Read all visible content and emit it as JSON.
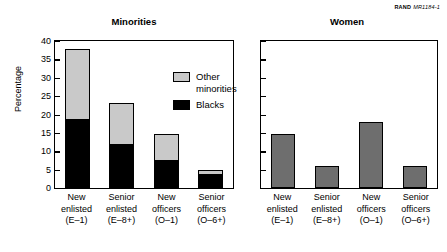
{
  "credit": {
    "brand": "RAND",
    "id": "MR1184-1"
  },
  "chart_data": {
    "type": "bar",
    "title": "",
    "categories": [
      "New enlisted (E–1)",
      "Senior enlisted (E–8+)",
      "New officers (O–1)",
      "Senior officers (O–6+)"
    ],
    "category_lines": [
      [
        "New",
        "enlisted",
        "(E–1)"
      ],
      [
        "Senior",
        "enlisted",
        "(E–8+)"
      ],
      [
        "New",
        "officers",
        "(O–1)"
      ],
      [
        "Senior",
        "officers",
        "(O–6+)"
      ]
    ],
    "ylabel": "Percentage",
    "ylim": [
      0,
      40
    ],
    "yticks": [
      40,
      35,
      30,
      25,
      20,
      15,
      10,
      5,
      0
    ],
    "grid": false,
    "panels": [
      {
        "title": "Minorities",
        "stacked": true,
        "legend_position": "inside-top-right",
        "series": [
          {
            "name": "Blacks",
            "color": "#000000",
            "values": [
              18.9,
              11.9,
              7.5,
              3.9
            ]
          },
          {
            "name": "Other minorities",
            "color": "#c9c9c9",
            "values": [
              18.9,
              11.1,
              7.1,
              0.9
            ]
          }
        ],
        "totals": [
          37.8,
          23.0,
          14.6,
          4.8
        ]
      },
      {
        "title": "Women",
        "stacked": false,
        "axis_labels_shown": false,
        "series": [
          {
            "name": "Women",
            "color": "#6e6e6e",
            "values": [
              14.6,
              6.0,
              18.0,
              6.0
            ]
          }
        ]
      }
    ]
  }
}
